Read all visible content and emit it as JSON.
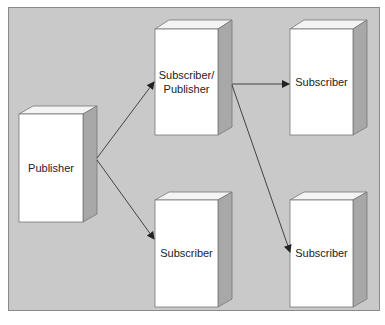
{
  "diagram": {
    "nodes": [
      {
        "id": "publisher",
        "label": "Publisher",
        "x": 19,
        "y": 114,
        "w": 64,
        "h": 108
      },
      {
        "id": "subpub",
        "label": "Subscriber/\nPublisher",
        "label_lines": [
          "Subscriber/",
          "Publisher"
        ],
        "x": 155,
        "y": 29,
        "w": 63,
        "h": 106
      },
      {
        "id": "sub_tr",
        "label": "Subscriber",
        "x": 290,
        "y": 29,
        "w": 63,
        "h": 106
      },
      {
        "id": "sub_bm",
        "label": "Subscriber",
        "x": 155,
        "y": 200,
        "w": 63,
        "h": 107
      },
      {
        "id": "sub_br",
        "label": "Subscriber",
        "x": 290,
        "y": 200,
        "w": 63,
        "h": 107
      }
    ],
    "edges": [
      {
        "from": "publisher",
        "to": "subpub"
      },
      {
        "from": "publisher",
        "to": "sub_bm"
      },
      {
        "from": "subpub",
        "to": "sub_tr"
      },
      {
        "from": "subpub",
        "to": "sub_br"
      }
    ],
    "colors": {
      "background": "#c9c9c9",
      "box_front": "#ffffff",
      "box_top": "#f4f4f4",
      "box_side": "#a8a8a8",
      "edge": "#333333"
    }
  }
}
